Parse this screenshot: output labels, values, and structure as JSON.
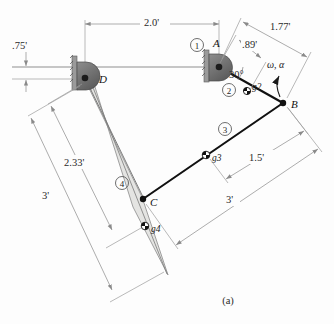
{
  "figure": {
    "caption": "(a)"
  },
  "dimensions": [
    {
      "id": "ground-length",
      "label": "2.0'",
      "value": 2.0,
      "units": "ft",
      "from": "D",
      "to": "A"
    },
    {
      "id": "crank-offset",
      "label": ".75'",
      "value": 0.75,
      "units": "ft",
      "from": "A-axis",
      "to": "D-axis"
    },
    {
      "id": "crank-cg-distance",
      "label": ".89'",
      "value": 0.89,
      "units": "ft",
      "from": "A",
      "to": "g2"
    },
    {
      "id": "crank-length",
      "label": "1.77'",
      "value": 1.77,
      "units": "ft",
      "from": "A",
      "to": "B"
    },
    {
      "id": "coupler-cg-distance",
      "label": "1.5'",
      "value": 1.5,
      "units": "ft",
      "from": "B",
      "to": "g3"
    },
    {
      "id": "coupler-length",
      "label": "3'",
      "value": 3.0,
      "units": "ft",
      "from": "B",
      "to": "C"
    },
    {
      "id": "rocker-cg-distance",
      "label": "2.33'",
      "value": 2.33,
      "units": "ft",
      "from": "D",
      "to": "g4"
    },
    {
      "id": "rocker-length",
      "label": "3'",
      "value": 3.0,
      "units": "ft",
      "from": "D",
      "to": "tip"
    }
  ],
  "angles": [
    {
      "id": "crank-angle",
      "label": "30°",
      "value": 30,
      "units": "deg",
      "at": "A"
    }
  ],
  "links": [
    {
      "number": "1",
      "badge": "①",
      "name": "ground-link"
    },
    {
      "number": "2",
      "badge": "②",
      "name": "crank-link"
    },
    {
      "number": "3",
      "badge": "③",
      "name": "coupler-link"
    },
    {
      "number": "4",
      "badge": "④",
      "name": "rocker-link"
    }
  ],
  "joints": [
    {
      "id": "A",
      "label": "A",
      "type": "fixed-pivot"
    },
    {
      "id": "B",
      "label": "B",
      "type": "pin-joint"
    },
    {
      "id": "C",
      "label": "C",
      "type": "pin-joint"
    },
    {
      "id": "D",
      "label": "D",
      "type": "fixed-pivot"
    }
  ],
  "centers_of_mass": [
    {
      "id": "g2",
      "label": "g2",
      "on_link": "2"
    },
    {
      "id": "g3",
      "label": "g3",
      "on_link": "3"
    },
    {
      "id": "g4",
      "label": "g4",
      "on_link": "4"
    }
  ],
  "annotations": [
    {
      "id": "input-motion",
      "label": "ω, α",
      "description": "angular velocity and acceleration of crank"
    }
  ],
  "colors": {
    "link_heavy": "#111111",
    "link_thin": "#8f8f8f",
    "dimension_line": "#8a8a8a",
    "pivot_fill": "#6e6e6e",
    "ternary_fill": "#e2e2e0",
    "background": "#fdfdfd"
  }
}
